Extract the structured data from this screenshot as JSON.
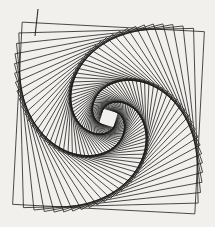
{
  "figure": {
    "type": "whirl-squares-pattern",
    "canvas": {
      "width": 215,
      "height": 227,
      "background": "#f1f0ec"
    },
    "whirl": {
      "center_x": 108.5,
      "center_y": 118,
      "corner_radius": 129,
      "initial_tilt_deg": 3,
      "step_rotation_deg": -4.5,
      "step_scale": 0.958,
      "square_count": 58,
      "stroke_color": "#1d1d1d",
      "stroke_width": 0.85,
      "stroke_opacity": 0.93,
      "blur_std_dev": 0.22
    },
    "stray_line": {
      "x1": 38,
      "y1": 9,
      "x2": 35,
      "y2": 36,
      "stroke_width": 1.1
    }
  }
}
